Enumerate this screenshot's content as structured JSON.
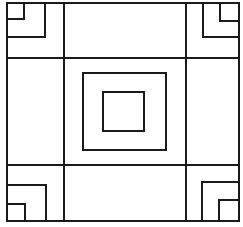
{
  "diagram": {
    "type": "geometric-pattern",
    "colors": {
      "stroke": "#1a1a1a",
      "background": "#ffffff"
    },
    "outer_border": {
      "x1": 7,
      "y1": 3,
      "x2": 239,
      "y2": 221
    },
    "grid": {
      "verticals": [
        64,
        186
      ],
      "horizontals": [
        58,
        165
      ]
    },
    "center_squares": [
      {
        "x": 83,
        "y": 73,
        "w": 83,
        "h": 77
      },
      {
        "x": 103,
        "y": 92,
        "w": 41,
        "h": 39
      }
    ],
    "corners": [
      {
        "name": "top-left",
        "small": [
          7,
          3,
          24,
          19
        ],
        "large": [
          7,
          3,
          45,
          37
        ]
      },
      {
        "name": "top-right",
        "small": [
          220,
          3,
          239,
          21
        ],
        "large": [
          203,
          3,
          239,
          37
        ]
      },
      {
        "name": "bottom-left",
        "small": [
          7,
          204,
          25,
          221
        ],
        "large": [
          7,
          185,
          46,
          221
        ]
      },
      {
        "name": "bottom-right",
        "small": [
          219,
          200,
          239,
          221
        ],
        "large": [
          202,
          182,
          239,
          221
        ]
      }
    ]
  }
}
